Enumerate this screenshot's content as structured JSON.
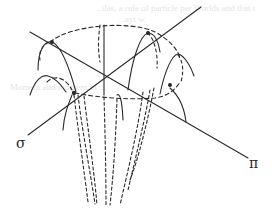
{
  "figure": {
    "labels": {
      "sigma": "σ",
      "pi": "π"
    },
    "bleed_through_text": [
      "...ilas, a rule of particle per Worlds and that t",
      "...ayt w.",
      "Moment and moment of ..."
    ],
    "colors": {
      "ink": "#2a2a2a",
      "background": "#ffffff",
      "bleed": "#e4e4e4"
    }
  }
}
